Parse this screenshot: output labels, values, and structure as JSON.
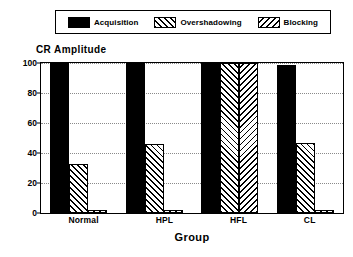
{
  "chart_data": {
    "type": "bar",
    "title": "",
    "ylabel": "CR Amplitude",
    "xlabel": "Group",
    "categories": [
      "Normal",
      "HPL",
      "HFL",
      "CL"
    ],
    "series": [
      {
        "name": "Acquisition",
        "pattern": "solid",
        "values": [
          100,
          100,
          100,
          99
        ]
      },
      {
        "name": "Overshadowing",
        "pattern": "forward-hatch",
        "values": [
          33,
          46,
          100,
          47
        ]
      },
      {
        "name": "Blocking",
        "pattern": "backward-hatch",
        "values": [
          2,
          2,
          100,
          2
        ]
      }
    ],
    "ylim": [
      0,
      100
    ],
    "yticks": [
      0,
      20,
      40,
      60,
      80,
      100
    ],
    "ytick_labels": [
      "0",
      "20",
      "40",
      "60",
      "80",
      "100"
    ],
    "grid": true,
    "grid_style": "dotted",
    "legend_position": "top",
    "colors": {
      "foreground": "#000000",
      "background": "#ffffff",
      "gridline": "#8a8a8a"
    }
  },
  "legend": {
    "items": [
      {
        "label": "Acquisition",
        "swatch": "solid-swatch"
      },
      {
        "label": "Overshadowing",
        "swatch": "forward-hatch-swatch"
      },
      {
        "label": "Blocking",
        "swatch": "backward-hatch-swatch"
      }
    ]
  }
}
